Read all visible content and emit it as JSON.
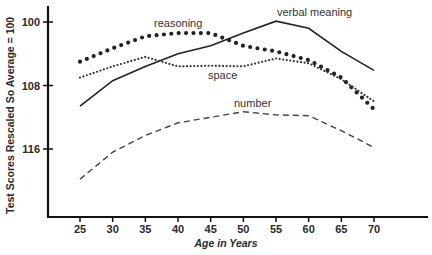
{
  "chart_data": {
    "type": "line",
    "title": "",
    "xlabel": "Age in Years",
    "ylabel": "Test Scores Rescaled So  Average = 100",
    "x": [
      25,
      30,
      35,
      40,
      45,
      50,
      55,
      60,
      65,
      70
    ],
    "xlim": [
      20,
      80
    ],
    "ylim": [
      91,
      118
    ],
    "yticks": [
      100,
      108,
      116
    ],
    "xticks": [
      25,
      30,
      35,
      40,
      45,
      50,
      55,
      60,
      65,
      70
    ],
    "grid": false,
    "legend": "inline labels",
    "series": [
      {
        "name": "verbal meaning",
        "style": "solid",
        "values": [
          105.4,
          108.6,
          110.4,
          112.0,
          113.0,
          114.6,
          116.1,
          115.2,
          112.3,
          109.9
        ],
        "label_pos": {
          "x": 55,
          "y": 116.9
        }
      },
      {
        "name": "reasoning",
        "style": "dots-large",
        "values": [
          111.0,
          112.7,
          114.2,
          114.6,
          114.6,
          113.0,
          112.3,
          111.2,
          109.0,
          105.0
        ],
        "label_pos": {
          "x": 36,
          "y": 115.6
        }
      },
      {
        "name": "space",
        "style": "dots-small",
        "values": [
          109.0,
          110.4,
          111.6,
          110.4,
          110.5,
          110.4,
          111.4,
          110.8,
          108.8,
          106.0
        ],
        "label_pos": {
          "x": 45,
          "y": 108.2
        }
      },
      {
        "name": "number",
        "style": "dashed",
        "values": [
          96.2,
          99.6,
          101.7,
          103.3,
          104.0,
          104.7,
          104.3,
          104.2,
          102.3,
          100.2
        ],
        "label_pos": {
          "x": 46,
          "y": 105.6
        }
      }
    ]
  },
  "axes": {
    "x_title": "Age in Years",
    "y_title": "Test Scores Rescaled So  Average = 100",
    "y_tick_labels": [
      "116",
      "108",
      "100"
    ],
    "x_tick_labels": [
      "25",
      "30",
      "35",
      "40",
      "45",
      "50",
      "55",
      "60",
      "65",
      "70"
    ]
  },
  "labels": {
    "verbal": "verbal meaning",
    "reasoning": "reasoning",
    "space": "space",
    "number": "number"
  }
}
